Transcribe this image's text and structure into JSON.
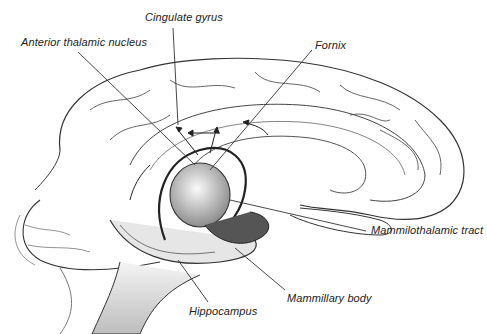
{
  "diagram": {
    "type": "anatomical illustration",
    "labels": [
      {
        "id": "cingulate-gyrus",
        "text": "Cingulate gyrus",
        "x": 145,
        "y": 11
      },
      {
        "id": "anterior-thalamic-nucleus",
        "text": "Anterior thalamic nucleus",
        "x": 21,
        "y": 36
      },
      {
        "id": "fornix",
        "text": "Fornix",
        "x": 315,
        "y": 39
      },
      {
        "id": "mammilothalamic-tract",
        "text": "Mammilothalamic tract",
        "x": 371,
        "y": 224
      },
      {
        "id": "mammillary-body",
        "text": "Mammillary body",
        "x": 287,
        "y": 292
      },
      {
        "id": "hippocampus",
        "text": "Hippocampus",
        "x": 189,
        "y": 305
      }
    ],
    "colors": {
      "ink": "#222222",
      "background": "#ffffff",
      "shade": "#9a9a9a"
    }
  }
}
